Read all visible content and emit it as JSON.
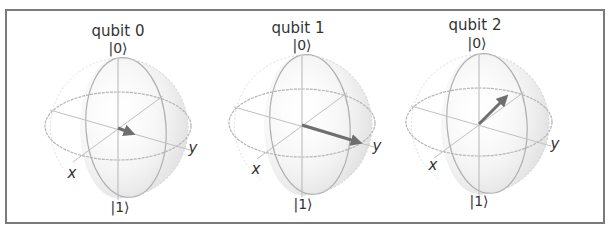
{
  "figure": {
    "type": "bloch_multivector",
    "spheres": [
      {
        "title": "qubit 0",
        "top_label": "|0⟩",
        "bottom_label": "|1⟩",
        "x_label": "x",
        "y_label": "y",
        "center": [
          118,
          128
        ],
        "vector_end": [
          131,
          133
        ]
      },
      {
        "title": "qubit 1",
        "top_label": "|0⟩",
        "bottom_label": "|1⟩",
        "x_label": "x",
        "y_label": "y",
        "center": [
          302,
          125
        ],
        "vector_end": [
          362,
          143
        ]
      },
      {
        "title": "qubit 2",
        "top_label": "|0⟩",
        "bottom_label": "|1⟩",
        "x_label": "x",
        "y_label": "y",
        "center": [
          479,
          124
        ],
        "vector_end": [
          508,
          95
        ]
      }
    ],
    "colors": {
      "border": "#7a7a7a",
      "wire": "#b5b5b5",
      "sphere_fill": "#e6e6e6",
      "vector": "#6e6e6e",
      "text": "#333333"
    }
  }
}
